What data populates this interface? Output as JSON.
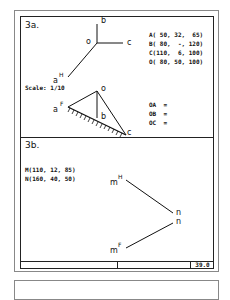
{
  "section_a": {
    "title": "3a.",
    "scale": "Scale: 1/10",
    "coordinates": [
      "A( 50, 32,  65)",
      "B( 80,  -, 120)",
      "C(110,  6, 100)",
      "O( 80, 50, 100)"
    ],
    "answers": [
      "OA  =",
      "OB  =",
      "OC  ="
    ],
    "plan_view_labels": {
      "b": "b",
      "o": "o",
      "c": "c",
      "a": "a",
      "a_sup": "H"
    },
    "elevation_labels": {
      "o": "o",
      "a": "a",
      "a_sup": "F",
      "b": "b",
      "c": "c"
    }
  },
  "section_b": {
    "title": "3b.",
    "coordinates": [
      "M(110, 12, 85)",
      "N(160, 40, 50)"
    ],
    "labels": {
      "m_top": "m",
      "m_top_sup": "H",
      "n_top": "n",
      "n_bottom": "n",
      "m_bottom": "m",
      "m_bottom_sup": "F"
    }
  },
  "footer": {
    "box_label": "39.0"
  }
}
